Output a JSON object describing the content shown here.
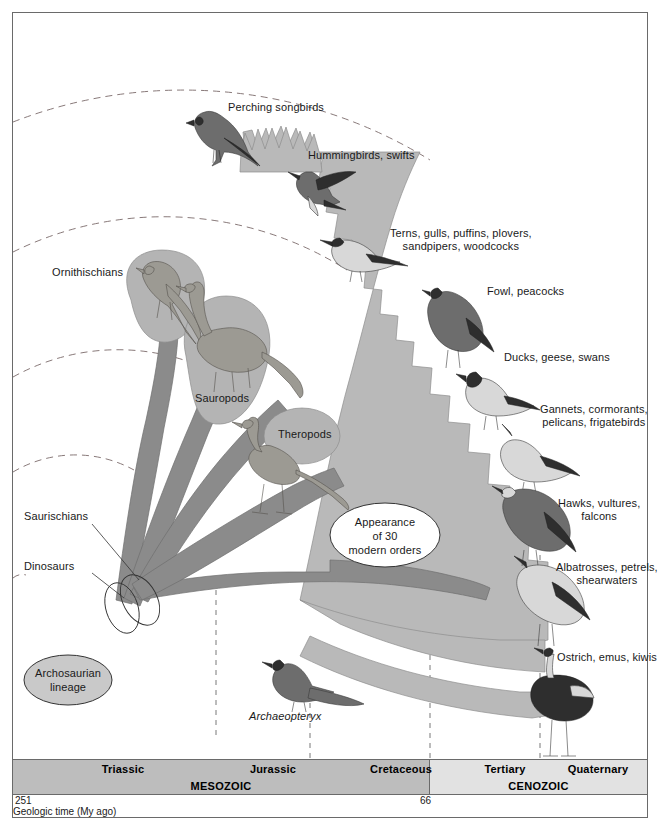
{
  "figure": {
    "type": "phylogenetic-fan-diagram"
  },
  "origin": {
    "label": "Archosaurian\nlineage"
  },
  "callout": {
    "label": "Appearance\nof 30\nmodern orders"
  },
  "left_labels": [
    {
      "name": "ornithischians",
      "text": "Ornithischians"
    },
    {
      "name": "sauropods",
      "text": "Sauropods"
    },
    {
      "name": "theropods",
      "text": "Theropods"
    },
    {
      "name": "saurischians",
      "text": "Saurischians"
    },
    {
      "name": "dinosaurs",
      "text": "Dinosaurs"
    },
    {
      "name": "archaeopteryx",
      "text": "Archaeopteryx",
      "italic": true
    }
  ],
  "bird_groups": [
    {
      "name": "perching-songbirds",
      "text": "Perching songbirds"
    },
    {
      "name": "hummingbirds-swifts",
      "text": "Hummingbirds, swifts"
    },
    {
      "name": "shorebirds",
      "text": "Terns, gulls, puffins, plovers,\nsandpipers, woodcocks"
    },
    {
      "name": "fowl-peacocks",
      "text": "Fowl, peacocks"
    },
    {
      "name": "waterfowl",
      "text": "Ducks, geese, swans"
    },
    {
      "name": "pelecaniformes",
      "text": "Gannets, cormorants,\npelicans, frigatebirds"
    },
    {
      "name": "raptors",
      "text": "Hawks, vultures,\nfalcons"
    },
    {
      "name": "tubenoses",
      "text": "Albatrosses, petrels,\nshearwaters"
    },
    {
      "name": "ratites",
      "text": "Ostrich, emus, kiwis"
    }
  ],
  "timescale": {
    "caption": "Geologic time (My ago)",
    "ticks": [
      {
        "name": "start-tick",
        "value": "251"
      },
      {
        "name": "kpg-tick",
        "value": "66"
      }
    ],
    "eras": [
      {
        "name": "mesozoic",
        "label": "MESOZOIC"
      },
      {
        "name": "cenozoic",
        "label": "CENOZOIC"
      }
    ],
    "periods": [
      {
        "name": "triassic",
        "label": "Triassic"
      },
      {
        "name": "jurassic",
        "label": "Jurassic"
      },
      {
        "name": "cretaceous",
        "label": "Cretaceous"
      },
      {
        "name": "tertiary",
        "label": "Tertiary"
      },
      {
        "name": "quaternary",
        "label": "Quaternary"
      }
    ]
  },
  "colors": {
    "fan_fill": "#b9b9b9",
    "branch_fill": "#8b8b8b",
    "mesozoic_band": "#bdbdbd",
    "cenozoic_band": "#e2e2e2",
    "frame_stroke": "#6a6a6a",
    "arc_stroke": "#7a6a6a"
  }
}
